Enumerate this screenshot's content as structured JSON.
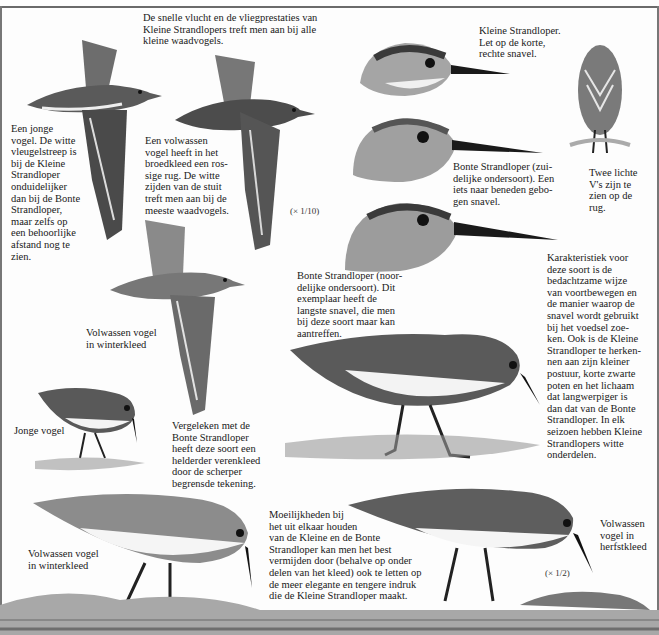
{
  "plate": {
    "subject": "Kleine Strandloper en Bonte Strandloper",
    "scales": {
      "flight": "(× 1/10)",
      "standing": "(× 1/2)"
    }
  },
  "captions": {
    "flight_intro": "De snelle vlucht en de vliegprestaties van\nKleine Strandlopers treft men aan bij alle\nkleine waadvogels.",
    "juvenile_flight": "Een jonge\nvogel. De witte\nvleugelstreep is\nbij de Kleine\nStrandloper\nonduidelijker\ndan bij de Bonte\nStrandloper,\nmaar zelfs op\neen behoorlijke\nafstand nog te\nzien.",
    "adult_breeding_flight": "Een volwassen\nvogel heeft in het\nbroedkleed een ros-\nsige rug. De witte\nzijden van de stuit\ntreft men aan bij de\nmeeste waadvogels.",
    "head_little_stint": "Kleine Strandloper.\nLet op de korte,\nrechte snavel.",
    "head_dunlin_south": "Bonte Strandloper (zui-\ndelijke ondersoort). Een\niets naar beneden gebo-\ngen snavel.",
    "back_view": "Twee lichte\nV's zijn te\nzien op de\nrug.",
    "head_dunlin_north": "Bonte Strandloper (noor-\ndelijke ondersoort). Dit\nexemplaar heeft de\nlangste snavel, die men\nbij deze soort maar kan\naantreffen.",
    "characteristic": "Karakteristiek voor\ndeze soort is de\nbedachtzame wijze\nvan voortbewegen en\nde manier waarop de\nsnavel wordt gebruikt\nbij het voedsel zoe-\nken. Ook is de Kleine\nStrandloper te herken-\nnen aan zijn kleiner\npostuur, korte zwarte\npoten en het lichaam\ndat langwerpiger is\ndan dat van de Bonte\nStrandloper. In elk\nseizoen hebben Kleine\nStrandlopers witte\nonderdelen.",
    "adult_winter_flight": "Volwassen vogel\nin winterkleed",
    "juvenile_standing": "Jonge vogel",
    "compared": "Vergeleken met de\nBonte Strandloper\nheeft deze soort een\nhelderder verenkleed\ndoor de scherper\nbegrensde tekening.",
    "adult_winter_standing": "Volwassen vogel\nin winterkleed",
    "difficulties": "Moeilijkheden bij\nhet uit elkaar houden\nvan de Kleine en de Bonte\nStrandloper kan men het best\nvermijden door (behalve op onder\ndelen van het kleed) ook te letten op\nde meer elegante en tengere indruk\ndie de Kleine Strandloper maakt.",
    "adult_autumn_standing": "Volwassen\nvogel in\nherfstkleed"
  },
  "colors": {
    "ink": "#1e1e1e",
    "plumage_dark": "#3a3a3a",
    "plumage_mid": "#8a8a8a",
    "plumage_light": "#c8c8c8",
    "belly": "#f4f4f4",
    "ground": "#9a9a9a"
  }
}
